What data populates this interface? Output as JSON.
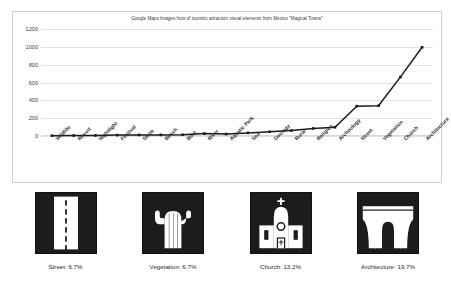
{
  "chart_data": {
    "type": "line",
    "title": "Google Maps Images hots of touristic attraction visual elements from Mexico \"Magical Towns\"",
    "xlabel": "",
    "ylabel": "",
    "ylim": [
      0,
      1200
    ],
    "yticks": [
      0,
      200,
      400,
      600,
      800,
      1000,
      1200
    ],
    "grid": true,
    "legend": "none",
    "marker": "square",
    "line_color": "#1a1a1a",
    "categories": [
      "Wildlife",
      "Resort",
      "Nightlight",
      "Festival",
      "Swim",
      "Beach",
      "Boat",
      "River",
      "Aquatic Park",
      "Sea",
      "Geology",
      "Rural",
      "Religion",
      "Archeology",
      "Street",
      "Vegetation",
      "Church",
      "Architecture"
    ],
    "values": [
      4,
      5,
      6,
      10,
      12,
      12,
      14,
      27,
      22,
      35,
      48,
      62,
      85,
      98,
      335,
      340,
      660,
      995
    ]
  },
  "y_axis": {
    "ticks": [
      "1200",
      "1000",
      "800",
      "600",
      "400",
      "200",
      "0"
    ]
  },
  "icon_panels": [
    {
      "name": "street",
      "icon": "road-icon",
      "caption": "Street: 6.7%",
      "percent": "6.7%"
    },
    {
      "name": "vegetation",
      "icon": "cactus-icon",
      "caption": "Vegetation: 6.7%",
      "percent": "6.7%"
    },
    {
      "name": "church",
      "icon": "church-icon",
      "caption": "Church: 13.2%",
      "percent": "13.2%"
    },
    {
      "name": "architecture",
      "icon": "aqueduct-icon",
      "caption": "Architecture: 19.7%",
      "percent": "19.7%"
    }
  ],
  "colors": {
    "icon_background": "#1c1c1c",
    "icon_foreground": "#ffffff",
    "gridline": "#e2e2e2",
    "series": "#1a1a1a"
  }
}
